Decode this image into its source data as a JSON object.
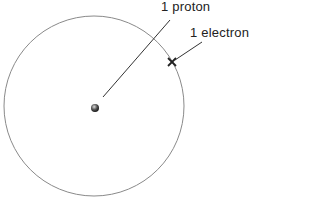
{
  "diagram": {
    "labels": {
      "proton": "1 proton",
      "electron": "1 electron"
    },
    "colors": {
      "orbit": "#8a8a8a",
      "line": "#333333",
      "nucleus": "#444444"
    }
  }
}
